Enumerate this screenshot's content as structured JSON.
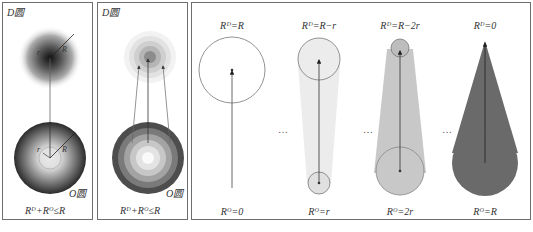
{
  "panels": [
    {
      "id": "panel-continuous",
      "top_label": "D圆",
      "bottom_circle_label": "O圆",
      "radius_labels": {
        "inner": "r",
        "outer": "R"
      },
      "condition": "Rᴰ+Rᴼ≤R"
    },
    {
      "id": "panel-discrete",
      "top_label": "D圆",
      "bottom_circle_label": "O圆",
      "condition": "Rᴰ+Rᴼ≤R"
    },
    {
      "id": "panel-progression",
      "top_labels": [
        "Rᴰ=R",
        "Rᴰ=R−r",
        "Rᴰ=R−2r",
        "Rᴰ=0"
      ],
      "bottom_labels": [
        "Rᴼ=0",
        "Rᴼ=r",
        "Rᴼ=2r",
        "Rᴼ=R"
      ],
      "ellipsis": "…",
      "colors": {
        "stage1_fill": "#ffffff",
        "stage2_fill": "#ebebeb",
        "stage3_fill": "#c8c8c8",
        "stage4_fill": "#6a6a6a",
        "outline": "#555555"
      }
    }
  ]
}
